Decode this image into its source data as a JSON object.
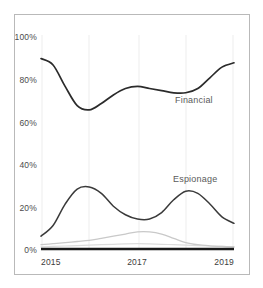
{
  "chart_data": {
    "type": "line",
    "title": "",
    "subtitle": "",
    "xlabel": "",
    "ylabel": "",
    "xlim": [
      2015,
      2019
    ],
    "ylim": [
      0,
      100
    ],
    "grid": "vertical-only",
    "legend_position": "inline-annotation",
    "y_ticks": [
      "100%",
      "80%",
      "60%",
      "40%",
      "20%",
      "0%"
    ],
    "y_tick_values": [
      100,
      80,
      60,
      40,
      20,
      0
    ],
    "x_ticks": [
      "2015",
      "2017",
      "2019"
    ],
    "x_tick_values": [
      2015,
      2017,
      2019
    ],
    "x": [
      2015.0,
      2015.25,
      2015.5,
      2015.75,
      2016.0,
      2016.25,
      2016.5,
      2016.75,
      2017.0,
      2017.25,
      2017.5,
      2017.75,
      2018.0,
      2018.25,
      2018.5,
      2018.75,
      2019.0
    ],
    "series": [
      {
        "name": "Financial",
        "label": "Financial",
        "color": "#2b2b2b",
        "stroke_width": 1.7,
        "annotation": "Financial",
        "values": [
          89,
          86,
          76,
          67,
          65,
          68,
          72,
          75,
          76,
          75,
          74,
          73,
          73,
          75,
          80,
          85,
          87
        ]
      },
      {
        "name": "Espionage",
        "label": "Espionage",
        "color": "#3a3a3a",
        "stroke_width": 1.5,
        "annotation": "Espionage",
        "values": [
          6,
          11,
          21,
          28,
          29,
          26,
          20,
          16,
          14,
          14,
          17,
          23,
          27,
          26,
          21,
          15,
          12
        ]
      },
      {
        "name": "Grudge",
        "label": "Grudge",
        "color": "#c9c9c9",
        "stroke_width": 1.3,
        "annotation": "",
        "values": [
          2,
          2.5,
          3,
          3.5,
          4,
          5,
          6,
          7,
          8,
          8,
          7,
          5,
          3,
          2,
          1.5,
          1.2,
          1
        ]
      },
      {
        "name": "Ideology",
        "label": "Ideology",
        "color": "#dcdcdc",
        "stroke_width": 1.2,
        "annotation": "",
        "values": [
          1,
          1.2,
          1.4,
          1.6,
          1.8,
          2,
          2.2,
          2.4,
          2.5,
          2.4,
          2.2,
          2,
          1.8,
          1.6,
          1.4,
          1.2,
          1
        ]
      }
    ],
    "annotations": [
      {
        "text": "Financial",
        "x": 2018.05,
        "y": 69
      },
      {
        "text": "Espionage",
        "x": 2018.1,
        "y": 32
      }
    ]
  }
}
